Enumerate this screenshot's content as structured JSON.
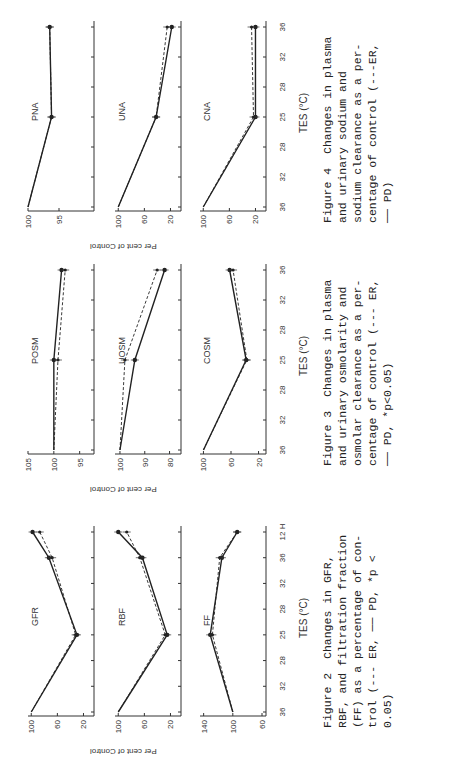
{
  "page": {
    "orientation": "rotated-90",
    "y_axis_label": "Per cent of Control",
    "x_axis_label": "TES (°C)"
  },
  "figures": [
    {
      "id": "figure-2",
      "caption_lines": [
        "Figure 2  Changes in GFR,",
        "RBF, and filtration fraction",
        "(FF) as a percentage of con-",
        "trol (--- ER, ── PD, *p <",
        "0.05)"
      ],
      "x_ticks": [
        "36",
        "32",
        "28",
        "25",
        "28",
        "32",
        "36",
        "12 H"
      ],
      "panels": [
        {
          "title": "GFR",
          "y_ticks": [
            "100",
            "60",
            "20"
          ]
        },
        {
          "title": "RBF",
          "y_ticks": [
            "100",
            "60",
            "20"
          ]
        },
        {
          "title": "FF",
          "y_ticks": [
            "140",
            "100",
            "60"
          ]
        }
      ]
    },
    {
      "id": "figure-3",
      "caption_lines": [
        "Figure 3  Changes in plasma",
        "and urinary osmolarity and",
        "osmolar clearance as a per-",
        "centage of control (--- ER,",
        "── PD, *p<0.05)"
      ],
      "x_ticks": [
        "36",
        "32",
        "28",
        "25",
        "28",
        "32",
        "36"
      ],
      "panels": [
        {
          "title": "POSM",
          "y_ticks": [
            "105",
            "100",
            "95"
          ]
        },
        {
          "title": "UOSM",
          "y_ticks": [
            "100",
            "90",
            "80"
          ]
        },
        {
          "title": "COSM",
          "y_ticks": [
            "100",
            "60",
            "20"
          ]
        }
      ]
    },
    {
      "id": "figure-4",
      "caption_lines": [
        "Figure 4  Changes in plasma",
        "and urinary sodium and",
        "sodium clearance as a per-",
        "centage of control (---ER,",
        "── PD)"
      ],
      "x_ticks": [
        "36",
        "32",
        "28",
        "25",
        "28",
        "32",
        "36"
      ],
      "panels": [
        {
          "title": "PNA",
          "y_ticks": [
            "100",
            "95"
          ]
        },
        {
          "title": "UNA",
          "y_ticks": [
            "100",
            "60",
            "20"
          ]
        },
        {
          "title": "CNA",
          "y_ticks": [
            "100",
            "60",
            "20"
          ]
        }
      ]
    }
  ],
  "chart_data": [
    {
      "type": "line",
      "title": "GFR",
      "categories": [
        "36",
        "32",
        "28",
        "25",
        "28",
        "32",
        "36",
        "12 H"
      ],
      "series": [
        {
          "name": "PD",
          "values": [
            100,
            null,
            null,
            30,
            null,
            null,
            73,
            98
          ]
        },
        {
          "name": "ER",
          "values": [
            100,
            null,
            null,
            32,
            null,
            null,
            68,
            87
          ]
        }
      ],
      "ylim": [
        10,
        105
      ]
    },
    {
      "type": "line",
      "title": "RBF",
      "categories": [
        "36",
        "32",
        "28",
        "25",
        "28",
        "32",
        "36",
        "12 H"
      ],
      "series": [
        {
          "name": "PD",
          "values": [
            100,
            null,
            null,
            25,
            null,
            null,
            63,
            100
          ]
        },
        {
          "name": "ER",
          "values": [
            100,
            null,
            null,
            28,
            null,
            null,
            67,
            87
          ]
        }
      ],
      "ylim": [
        10,
        105
      ]
    },
    {
      "type": "line",
      "title": "FF",
      "categories": [
        "36",
        "32",
        "28",
        "25",
        "28",
        "32",
        "36",
        "12 H"
      ],
      "series": [
        {
          "name": "PD",
          "values": [
            100,
            null,
            null,
            131,
            null,
            null,
            115,
            94
          ]
        },
        {
          "name": "ER",
          "values": [
            100,
            null,
            null,
            128,
            null,
            null,
            118,
            94
          ]
        }
      ],
      "ylim": [
        60,
        145
      ]
    },
    {
      "type": "line",
      "title": "POSM",
      "categories": [
        "36",
        "32",
        "28",
        "25",
        "28",
        "32",
        "36"
      ],
      "series": [
        {
          "name": "PD",
          "values": [
            100,
            null,
            null,
            100,
            null,
            null,
            98.5
          ]
        },
        {
          "name": "ER",
          "values": [
            100,
            null,
            null,
            99.2,
            null,
            null,
            97.8
          ]
        }
      ],
      "ylim": [
        93,
        105
      ]
    },
    {
      "type": "line",
      "title": "UOSM",
      "categories": [
        "36",
        "32",
        "28",
        "25",
        "28",
        "32",
        "36"
      ],
      "series": [
        {
          "name": "PD",
          "values": [
            100,
            null,
            null,
            94,
            null,
            null,
            82
          ]
        },
        {
          "name": "ER",
          "values": [
            100,
            null,
            null,
            98,
            null,
            null,
            85
          ]
        }
      ],
      "ylim": [
        77,
        102
      ]
    },
    {
      "type": "line",
      "title": "COSM",
      "categories": [
        "36",
        "32",
        "28",
        "25",
        "28",
        "32",
        "36"
      ],
      "series": [
        {
          "name": "PD",
          "values": [
            100,
            null,
            null,
            38,
            null,
            null,
            62
          ]
        },
        {
          "name": "ER",
          "values": [
            100,
            null,
            null,
            37,
            null,
            null,
            57
          ]
        }
      ],
      "ylim": [
        15,
        105
      ]
    },
    {
      "type": "line",
      "title": "PNA",
      "categories": [
        "36",
        "32",
        "28",
        "25",
        "28",
        "32",
        "36"
      ],
      "series": [
        {
          "name": "PD",
          "values": [
            100,
            null,
            null,
            96.2,
            null,
            null,
            96.5
          ]
        },
        {
          "name": "ER",
          "values": [
            100,
            null,
            null,
            96.2,
            null,
            null,
            96.5
          ]
        }
      ],
      "ylim": [
        90,
        100
      ]
    },
    {
      "type": "line",
      "title": "UNA",
      "categories": [
        "36",
        "32",
        "28",
        "25",
        "28",
        "32",
        "36"
      ],
      "series": [
        {
          "name": "PD",
          "values": [
            100,
            null,
            null,
            42,
            null,
            null,
            18
          ]
        },
        {
          "name": "ER",
          "values": [
            100,
            null,
            null,
            42,
            null,
            null,
            25
          ]
        }
      ],
      "ylim": [
        10,
        105
      ]
    },
    {
      "type": "line",
      "title": "CNA",
      "categories": [
        "36",
        "32",
        "28",
        "25",
        "28",
        "32",
        "36"
      ],
      "series": [
        {
          "name": "PD",
          "values": [
            100,
            null,
            null,
            20,
            null,
            null,
            20
          ]
        },
        {
          "name": "ER",
          "values": [
            100,
            null,
            null,
            23,
            null,
            null,
            26
          ]
        }
      ],
      "ylim": [
        10,
        105
      ]
    }
  ]
}
